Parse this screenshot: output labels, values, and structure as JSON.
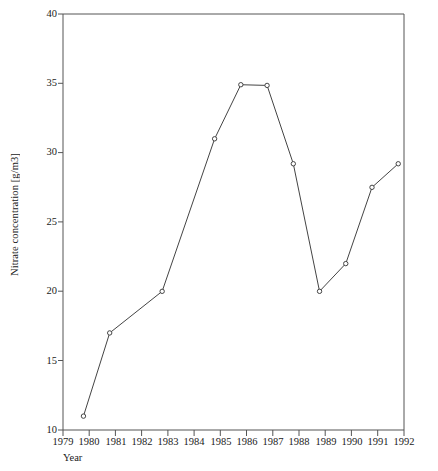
{
  "chart_data": {
    "type": "line",
    "title": "",
    "xlabel": "Year",
    "ylabel": "Nitrate concentration [g/m3]",
    "x": [
      1979,
      1980,
      1981,
      1982,
      1983,
      1984,
      1985,
      1986,
      1987,
      1988,
      1989,
      1990,
      1991
    ],
    "values": [
      11.0,
      17.0,
      null,
      20.0,
      null,
      31.0,
      34.9,
      34.85,
      29.2,
      20.0,
      22.0,
      27.5,
      29.2
    ],
    "points": [
      {
        "x": 1979,
        "y": 11.0
      },
      {
        "x": 1980,
        "y": 17.0
      },
      {
        "x": 1982,
        "y": 20.0
      },
      {
        "x": 1984,
        "y": 31.0
      },
      {
        "x": 1985,
        "y": 34.9
      },
      {
        "x": 1986,
        "y": 34.85
      },
      {
        "x": 1987,
        "y": 29.2
      },
      {
        "x": 1988,
        "y": 20.0
      },
      {
        "x": 1989,
        "y": 22.0
      },
      {
        "x": 1990,
        "y": 27.5
      },
      {
        "x": 1991,
        "y": 29.2
      }
    ],
    "xlim": [
      1979,
      1992
    ],
    "ylim": [
      10,
      40
    ],
    "x_ticks": [
      "1979",
      "1980",
      "1981",
      "1982",
      "1983",
      "1984",
      "1985",
      "1986",
      "1987",
      "1988",
      "1989",
      "1990",
      "1991",
      "1992"
    ],
    "y_ticks": [
      "10",
      "15",
      "20",
      "25",
      "30",
      "35",
      "40"
    ],
    "grid": false,
    "legend": "none",
    "marker": "open-circle",
    "line_color": "#444444",
    "axis_color": "#555555",
    "background_color": "#ffffff"
  }
}
